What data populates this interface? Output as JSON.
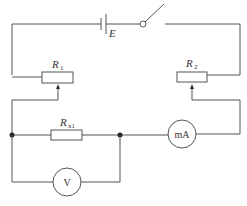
{
  "diagram": {
    "type": "circuit",
    "components": {
      "battery": {
        "label": "E"
      },
      "switch": {
        "label": "",
        "state": "open"
      },
      "rheostat_1": {
        "label": "R",
        "subscript": "1"
      },
      "rheostat_2": {
        "label": "R",
        "subscript": "2"
      },
      "resistor_x": {
        "label": "R",
        "subscript": "x1"
      },
      "ammeter": {
        "label": "mA"
      },
      "voltmeter": {
        "label": "V"
      }
    }
  }
}
